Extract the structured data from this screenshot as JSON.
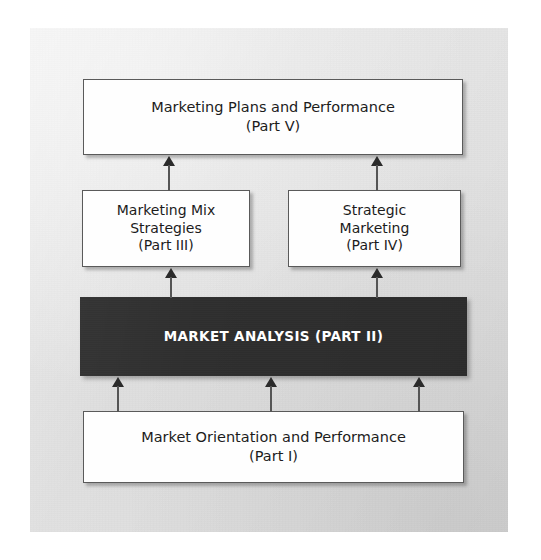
{
  "diagram": {
    "background_color": "#e3e3e3",
    "page_color": "#ffffff",
    "emphasis_color": "#2f2f2f",
    "box_border_color": "#5a5a5a",
    "box_fill_color": "#fefefe",
    "arrow_color": "#555555",
    "nodes": [
      {
        "id": "part5",
        "line1": "Marketing Plans and Performance",
        "line2": "(Part V)",
        "line3": "",
        "emphasis": false
      },
      {
        "id": "part3",
        "line1": "Marketing Mix",
        "line2": "Strategies",
        "line3": "(Part III)",
        "emphasis": false
      },
      {
        "id": "part4",
        "line1": "Strategic",
        "line2": "Marketing",
        "line3": "(Part IV)",
        "emphasis": false
      },
      {
        "id": "part2",
        "line1": "MARKET ANALYSIS",
        "line2": "(PART II)",
        "line3": "",
        "emphasis": true
      },
      {
        "id": "part1",
        "line1": "Market Orientation and Performance",
        "line2": "(Part I)",
        "line3": "",
        "emphasis": false
      }
    ],
    "edges": [
      {
        "id": "part3-to-part5",
        "from": "part3",
        "to": "part5",
        "direction": "up"
      },
      {
        "id": "part4-to-part5",
        "from": "part4",
        "to": "part5",
        "direction": "up"
      },
      {
        "id": "part2-to-part3",
        "from": "part2",
        "to": "part3",
        "direction": "up"
      },
      {
        "id": "part2-to-part4",
        "from": "part2",
        "to": "part4",
        "direction": "up"
      },
      {
        "id": "part1-to-part2-left",
        "from": "part1",
        "to": "part2",
        "direction": "up"
      },
      {
        "id": "part1-to-part2-center",
        "from": "part1",
        "to": "part2",
        "direction": "up"
      },
      {
        "id": "part1-to-part2-right",
        "from": "part1",
        "to": "part2",
        "direction": "up"
      }
    ]
  }
}
